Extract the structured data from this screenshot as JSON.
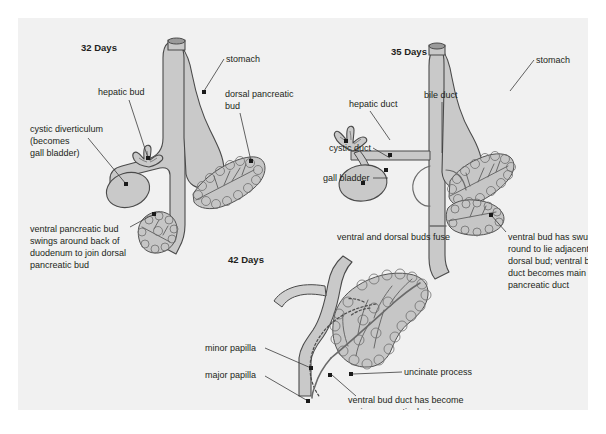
{
  "figure": {
    "background_color": "#f1f1f1",
    "page_color": "#ffffff",
    "organ_fill": "#c9c9c9",
    "outline_color": "#4a4a4a",
    "text_color": "#231f20"
  },
  "panels": [
    {
      "id": "panel-32-days",
      "title": "32 Days",
      "caption": "ventral pancreatic bud swings around back of duodenum to join dorsal pancreatic bud",
      "caption_lines": [
        "ventral pancreatic bud",
        "swings around back of",
        "duodenum to join dorsal",
        "pancreatic bud"
      ],
      "labels": [
        {
          "name": "hepatic-bud",
          "text": "hepatic bud"
        },
        {
          "name": "stomach",
          "text": "stomach"
        },
        {
          "name": "dorsal-pancreatic-bud",
          "text": "dorsal pancreatic bud",
          "lines": [
            "dorsal pancreatic",
            "bud"
          ]
        },
        {
          "name": "cystic-diverticulum",
          "text": "cystic diverticulum (becomes gall bladder)",
          "lines": [
            "cystic diverticulum",
            "(becomes",
            "gall bladder)"
          ]
        }
      ]
    },
    {
      "id": "panel-35-days",
      "title": "35 Days",
      "caption": "ventral and dorsal buds fuse",
      "caption_lines": [
        "ventral and dorsal buds fuse"
      ],
      "labels": [
        {
          "name": "hepatic-duct",
          "text": "hepatic duct"
        },
        {
          "name": "bile-duct",
          "text": "bile duct"
        },
        {
          "name": "stomach",
          "text": "stomach"
        },
        {
          "name": "cystic-duct",
          "text": "cystic duct"
        },
        {
          "name": "gall-bladder",
          "text": "gall bladder"
        },
        {
          "name": "ventral-bud-swung",
          "text": "ventral bud has swung round to lie adjacent to dorsal bud; ventral bud duct becomes main pancreatic duct",
          "lines": [
            "ventral bud has swung",
            "round to lie adjacent to",
            "dorsal bud; ventral bud",
            "duct becomes main",
            "pancreatic duct"
          ]
        }
      ]
    },
    {
      "id": "panel-42-days",
      "title": "42 Days",
      "caption": "ventral bud duct has become main pancreatic duct",
      "caption_lines": [
        "ventral bud duct has become",
        "main pancreatic duct"
      ],
      "labels": [
        {
          "name": "minor-papilla",
          "text": "minor papilla"
        },
        {
          "name": "major-papilla",
          "text": "major papilla"
        },
        {
          "name": "uncinate-process",
          "text": "uncinate process"
        }
      ]
    }
  ],
  "text": {
    "t32_title": "32 Days",
    "t32_hepatic_bud": "hepatic bud",
    "t32_stomach": "stomach",
    "t32_dorsal_1": "dorsal pancreatic",
    "t32_dorsal_2": "bud",
    "t32_cystic_1": "cystic diverticulum",
    "t32_cystic_2": "(becomes",
    "t32_cystic_3": "gall bladder)",
    "t32_cap_1": "ventral pancreatic bud",
    "t32_cap_2": "swings around back of",
    "t32_cap_3": "duodenum to join dorsal",
    "t32_cap_4": "pancreatic bud",
    "t35_title": "35 Days",
    "t35_hepatic_duct": "hepatic duct",
    "t35_bile_duct": "bile duct",
    "t35_stomach": "stomach",
    "t35_cystic_duct": "cystic duct",
    "t35_gall_bladder": "gall bladder",
    "t35_fuse": "ventral and dorsal buds fuse",
    "t35_cap_1": "ventral bud has swung",
    "t35_cap_2": "round to lie adjacent to",
    "t35_cap_3": "dorsal bud; ventral bud",
    "t35_cap_4": "duct becomes main",
    "t35_cap_5": "pancreatic duct",
    "t42_title": "42 Days",
    "t42_minor_papilla": "minor papilla",
    "t42_major_papilla": "major papilla",
    "t42_uncinate": "uncinate process",
    "t42_cap_1": "ventral bud duct has become",
    "t42_cap_2": "main pancreatic duct"
  }
}
